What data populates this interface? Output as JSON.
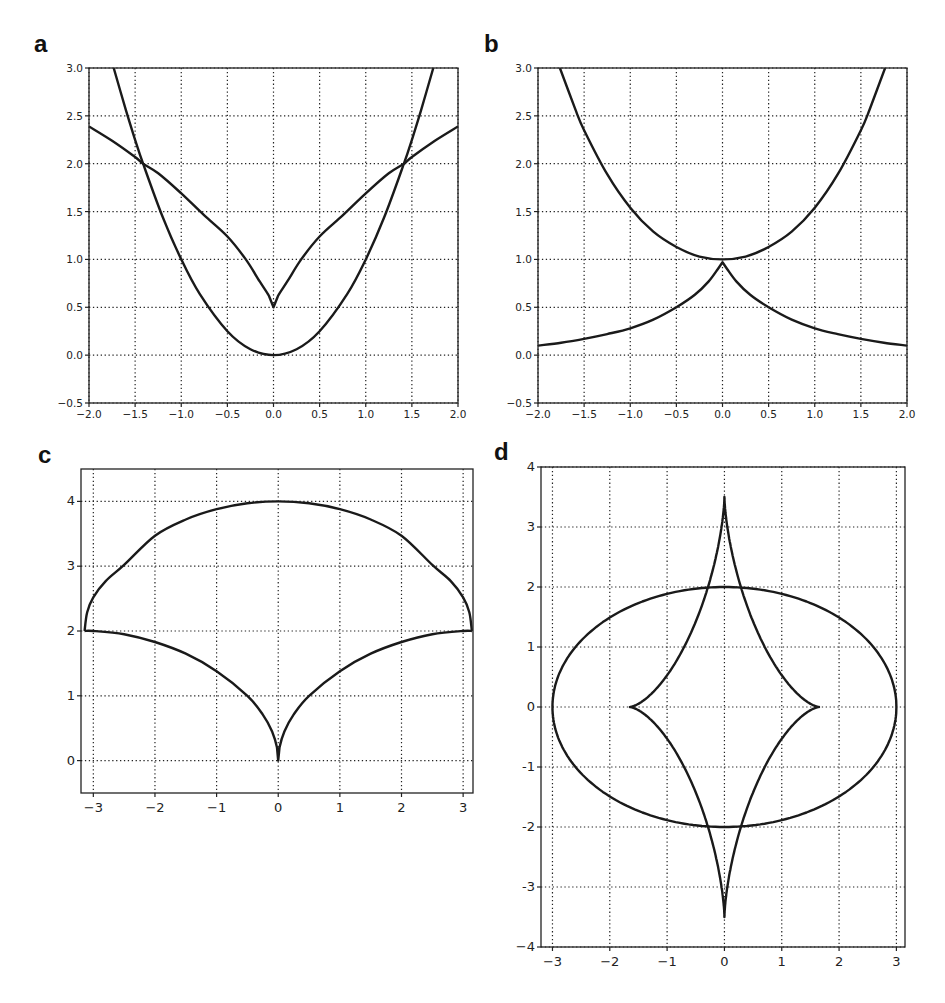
{
  "chart_data": [
    {
      "panel": "a",
      "type": "line",
      "title": "",
      "xlabel": "",
      "ylabel": "",
      "xlim": [
        -2.0,
        2.0
      ],
      "ylim": [
        -0.5,
        3.0
      ],
      "xticks": [
        "-2.0",
        "-1.5",
        "-1.0",
        "-0.5",
        "0.0",
        "0.5",
        "1.0",
        "1.5",
        "2.0"
      ],
      "yticks": [
        "-0.5",
        "0.0",
        "0.5",
        "1.0",
        "1.5",
        "2.0",
        "2.5",
        "3.0"
      ],
      "grid": "dotted",
      "series": [
        {
          "name": "parabola",
          "x": [
            -1.732,
            -1.6,
            -1.5,
            -1.414,
            -1.2,
            -1.0,
            -0.8,
            -0.5,
            -0.25,
            0,
            0.25,
            0.5,
            0.8,
            1.0,
            1.2,
            1.414,
            1.5,
            1.6,
            1.732
          ],
          "y": [
            3.0,
            2.56,
            2.25,
            2.0,
            1.44,
            1.0,
            0.64,
            0.25,
            0.0625,
            0,
            0.0625,
            0.25,
            0.64,
            1.0,
            1.44,
            2.0,
            2.25,
            2.56,
            3.0
          ]
        },
        {
          "name": "cusp-curve",
          "x": [
            -2.0,
            -1.75,
            -1.5,
            -1.414,
            -1.25,
            -1.0,
            -0.75,
            -0.5,
            -0.3,
            -0.15,
            -0.05,
            0,
            0.05,
            0.15,
            0.3,
            0.5,
            0.75,
            1.0,
            1.25,
            1.414,
            1.5,
            1.75,
            2.0
          ],
          "y": [
            2.39,
            2.24,
            2.07,
            2.0,
            1.9,
            1.69,
            1.46,
            1.24,
            1.0,
            0.77,
            0.62,
            0.5,
            0.62,
            0.77,
            1.0,
            1.24,
            1.46,
            1.69,
            1.9,
            2.0,
            2.07,
            2.24,
            2.39
          ]
        }
      ]
    },
    {
      "panel": "b",
      "type": "line",
      "title": "",
      "xlabel": "",
      "ylabel": "",
      "xlim": [
        -2.0,
        2.0
      ],
      "ylim": [
        -0.5,
        3.0
      ],
      "xticks": [
        "-2.0",
        "-1.5",
        "-1.0",
        "-0.5",
        "0.0",
        "0.5",
        "1.0",
        "1.5",
        "2.0"
      ],
      "yticks": [
        "-0.5",
        "0.0",
        "0.5",
        "1.0",
        "1.5",
        "2.0",
        "2.5",
        "3.0"
      ],
      "grid": "dotted",
      "series": [
        {
          "name": "upper-curve",
          "x": [
            -1.763,
            -1.6,
            -1.5,
            -1.25,
            -1.0,
            -0.75,
            -0.5,
            -0.25,
            0,
            0.25,
            0.5,
            0.75,
            1.0,
            1.25,
            1.5,
            1.6,
            1.763
          ],
          "y": [
            3.0,
            2.58,
            2.35,
            1.89,
            1.54,
            1.29,
            1.13,
            1.03,
            1.0,
            1.03,
            1.13,
            1.29,
            1.54,
            1.89,
            2.35,
            2.58,
            3.0
          ]
        },
        {
          "name": "lower-curve",
          "x": [
            -2.0,
            -1.75,
            -1.5,
            -1.25,
            -1.0,
            -0.75,
            -0.5,
            -0.3,
            -0.15,
            -0.05,
            0,
            0.05,
            0.15,
            0.3,
            0.5,
            0.75,
            1.0,
            1.25,
            1.5,
            1.75,
            2.0
          ],
          "y": [
            0.1,
            0.13,
            0.17,
            0.22,
            0.28,
            0.37,
            0.5,
            0.63,
            0.77,
            0.9,
            0.97,
            0.9,
            0.77,
            0.63,
            0.5,
            0.37,
            0.28,
            0.22,
            0.17,
            0.13,
            0.1
          ]
        }
      ]
    },
    {
      "panel": "c",
      "type": "line",
      "title": "",
      "xlabel": "",
      "ylabel": "",
      "xlim": [
        -3.2,
        3.16
      ],
      "ylim": [
        -0.5,
        4.5
      ],
      "xticks": [
        "-3",
        "-2",
        "-1",
        "0",
        "1",
        "2",
        "3"
      ],
      "yticks": [
        "0",
        "1",
        "2",
        "3",
        "4"
      ],
      "grid": "dotted",
      "series": [
        {
          "name": "upper-arc",
          "x": [
            -3.1416,
            -3.1,
            -3.0,
            -2.8,
            -2.5,
            -2.0,
            -1.5,
            -1.0,
            -0.5,
            0,
            0.5,
            1.0,
            1.5,
            2.0,
            2.5,
            2.8,
            3.0,
            3.1,
            3.1416
          ],
          "y": [
            2.0,
            2.29,
            2.52,
            2.77,
            3.02,
            3.47,
            3.72,
            3.88,
            3.97,
            4.0,
            3.97,
            3.88,
            3.72,
            3.47,
            3.02,
            2.77,
            2.52,
            2.29,
            2.0
          ]
        },
        {
          "name": "lower-cusp",
          "x": [
            -3.1416,
            -3.0,
            -2.5,
            -2.0,
            -1.5,
            -1.0,
            -0.5,
            -0.25,
            -0.1,
            -0.02,
            0,
            0.02,
            0.1,
            0.25,
            0.5,
            1.0,
            1.5,
            2.0,
            2.5,
            3.0,
            3.1416
          ],
          "y": [
            2.0,
            2.0,
            1.95,
            1.83,
            1.65,
            1.38,
            1.0,
            0.71,
            0.45,
            0.2,
            0.0,
            0.2,
            0.45,
            0.71,
            1.0,
            1.38,
            1.65,
            1.83,
            1.95,
            2.0,
            2.0
          ]
        }
      ]
    },
    {
      "panel": "d",
      "type": "line",
      "title": "",
      "xlabel": "",
      "ylabel": "",
      "xlim": [
        -3.2,
        3.15
      ],
      "ylim": [
        -4,
        4
      ],
      "xticks": [
        "-3",
        "-2",
        "-1",
        "0",
        "1",
        "2",
        "3"
      ],
      "yticks": [
        "-4",
        "-3",
        "-2",
        "-1",
        "0",
        "1",
        "2",
        "3",
        "4"
      ],
      "grid": "dotted",
      "series": [
        {
          "name": "ellipse",
          "parametric": "x=3cos(t), y=2sin(t)",
          "a": 3.0,
          "b": 2.0
        },
        {
          "name": "astroid",
          "parametric": "x=1.65cos^3(t), y=3.5sin^3(t)",
          "a": 1.65,
          "b": 3.5
        }
      ]
    }
  ],
  "panels": {
    "a": {
      "label": "a"
    },
    "b": {
      "label": "b"
    },
    "c": {
      "label": "c"
    },
    "d": {
      "label": "d"
    }
  }
}
